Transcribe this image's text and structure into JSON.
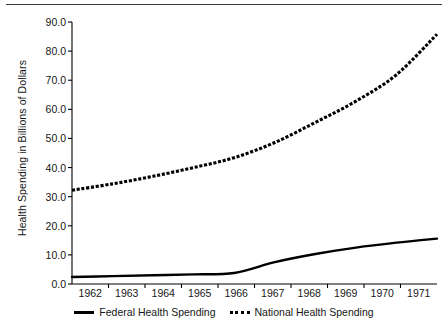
{
  "chart_data": {
    "type": "line",
    "title": "",
    "subtitle": "",
    "xlabel": "",
    "ylabel": "Health Spending in Billions of Dollars",
    "categories": [
      "1962",
      "1963",
      "1964",
      "1965",
      "1966",
      "1967",
      "1968",
      "1969",
      "1970",
      "1971"
    ],
    "x": [
      1962,
      1963,
      1964,
      1965,
      1966,
      1967,
      1968,
      1969,
      1970,
      1971
    ],
    "xlim": [
      1962,
      1971
    ],
    "ylim": [
      0.0,
      90.0
    ],
    "yticks": [
      0.0,
      10.0,
      20.0,
      30.0,
      40.0,
      50.0,
      60.0,
      70.0,
      80.0,
      90.0
    ],
    "ytick_labels": [
      "0.0",
      "10.0",
      "20.0",
      "30.0",
      "40.0",
      "50.0",
      "60.0",
      "70.0",
      "80.0",
      "90.0"
    ],
    "grid": false,
    "legend_position": "bottom",
    "series": [
      {
        "name": "Federal Health Spending",
        "style": "solid",
        "color": "#000000",
        "values": [
          2.4,
          2.7,
          3.0,
          3.3,
          3.8,
          7.5,
          10.3,
          12.5,
          14.2,
          15.6
        ]
      },
      {
        "name": "National Health Spending",
        "style": "dotted",
        "color": "#000000",
        "values": [
          32.2,
          34.4,
          37.0,
          40.0,
          43.4,
          48.6,
          55.5,
          62.8,
          71.9,
          85.8
        ]
      }
    ]
  },
  "legend": {
    "items": [
      {
        "label": "Federal Health Spending",
        "style": "solid"
      },
      {
        "label": "National Health Spending",
        "style": "dotted"
      }
    ]
  }
}
